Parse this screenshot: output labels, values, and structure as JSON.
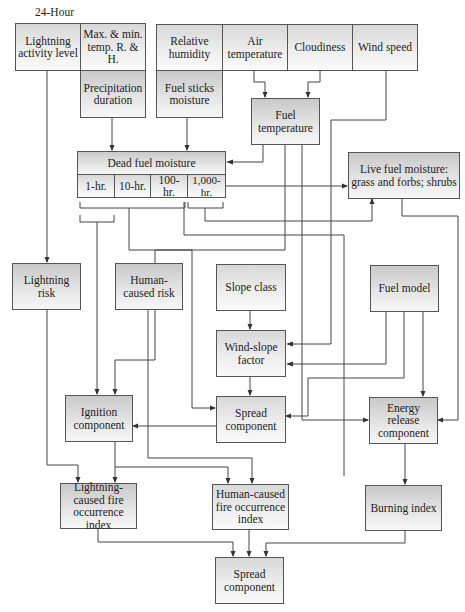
{
  "header": {
    "period_label": "24-Hour"
  },
  "inputs": {
    "lightning_activity": "Lightning activity level",
    "max_min_temp": "Max. & min. temp. R. & H.",
    "relative_humidity": "Relative humidity",
    "air_temperature": "Air temperature",
    "cloudiness": "Cloudiness",
    "wind_speed": "Wind speed",
    "precipitation_duration": "Precipitation duration",
    "fuel_sticks_moisture": "Fuel sticks moisture",
    "fuel_temperature": "Fuel temperature"
  },
  "dead_fuel": {
    "title": "Dead fuel moisture",
    "classes": [
      "1-hr.",
      "10-hr.",
      "100-hr.",
      "1,000-hr."
    ]
  },
  "live_fuel": {
    "title": "Live fuel moisture: grass and forbs; shrubs"
  },
  "middle": {
    "lightning_risk": "Lightning risk",
    "human_risk": "Human-caused risk",
    "slope_class": "Slope class",
    "fuel_model": "Fuel model",
    "wind_slope": "Wind-slope factor"
  },
  "components": {
    "ignition": "Ignition component",
    "spread": "Spread component",
    "energy_release": "Energy release component"
  },
  "indices": {
    "lightning_fire": "Lightning-caused fire occurrence index",
    "human_fire": "Human-caused fire occurrence index",
    "burning": "Burning index"
  },
  "output": {
    "final": "Spread component"
  },
  "colors": {
    "box_top": "#c9c9c9",
    "box_bottom": "#f7f7f7",
    "border": "#555555",
    "line": "#444444"
  }
}
